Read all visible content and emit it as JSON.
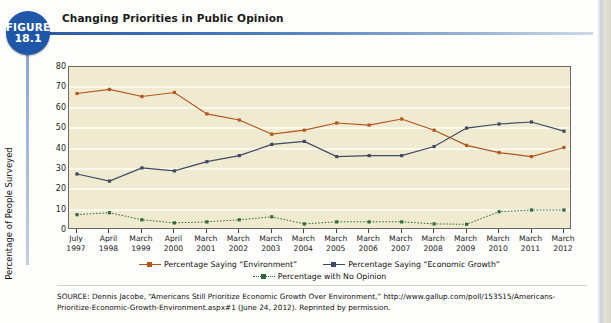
{
  "figure": {
    "badge_label": "FIGURE",
    "badge_number": "18.1"
  },
  "title": "Changing Priorities in Public Opinion",
  "source": "SOURCE: Dennis Jacobe, “Americans Still Prioritize Economic Growth Over Environment,” http://www.gallup.com/poll/153515/Americans-Prioritize-Economic-Growth-Environment.aspx#1 (June 24, 2012). Reprinted by permission.",
  "colors": {
    "environment": "#b5561f",
    "economic_growth": "#3c4a63",
    "no_opinion": "#2f6b42",
    "plot_background": "#f0ead0",
    "gridline": "#fbf8ec",
    "badge_blue": "#1e57a8",
    "title_rule": "#2a5ea8"
  },
  "chart_data": {
    "type": "line",
    "title": "Changing Priorities in Public Opinion",
    "xlabel": "",
    "ylabel": "Percentage of People Surveyed",
    "ylim": [
      0,
      80
    ],
    "yticks": [
      0,
      10,
      20,
      30,
      40,
      50,
      60,
      70,
      80
    ],
    "grid": true,
    "legend_position": "bottom",
    "categories": [
      "July 1997",
      "April 1998",
      "March 1999",
      "April 2000",
      "March 2001",
      "March 2002",
      "March 2003",
      "March 2004",
      "March 2005",
      "March 2006",
      "March 2007",
      "March 2008",
      "March 2009",
      "March 2010",
      "March 2011",
      "March 2012"
    ],
    "category_lines": [
      [
        "July",
        "1997"
      ],
      [
        "April",
        "1998"
      ],
      [
        "March",
        "1999"
      ],
      [
        "April",
        "2000"
      ],
      [
        "March",
        "2001"
      ],
      [
        "March",
        "2002"
      ],
      [
        "March",
        "2003"
      ],
      [
        "March",
        "2004"
      ],
      [
        "March",
        "2005"
      ],
      [
        "March",
        "2006"
      ],
      [
        "March",
        "2007"
      ],
      [
        "March",
        "2008"
      ],
      [
        "March",
        "2009"
      ],
      [
        "March",
        "2010"
      ],
      [
        "March",
        "2011"
      ],
      [
        "March",
        "2012"
      ]
    ],
    "series": [
      {
        "name": "Percentage Saying “Environment”",
        "color": "#b5561f",
        "style": "solid",
        "values": [
          67,
          69,
          65.5,
          67.5,
          57,
          54,
          47,
          49,
          52.5,
          51.5,
          54.5,
          49,
          41.5,
          38,
          36,
          40.5
        ]
      },
      {
        "name": "Percentage Saying “Economic Growth”",
        "color": "#3c4a63",
        "style": "solid",
        "values": [
          27.5,
          24,
          30.5,
          29,
          33.5,
          36.5,
          42,
          43.5,
          36,
          36.5,
          36.5,
          41,
          50,
          52,
          53,
          48.5
        ]
      },
      {
        "name": "Percentage with No Opinion",
        "color": "#2f6b42",
        "style": "dotted",
        "values": [
          7.5,
          8.5,
          5,
          3.5,
          4,
          5,
          6.5,
          3,
          4,
          4,
          4,
          3,
          2.8,
          9,
          9.8,
          9.8
        ]
      }
    ]
  },
  "legend": [
    {
      "label": "Percentage Saying “Environment”",
      "color": "#b5561f"
    },
    {
      "label": "Percentage Saying “Economic Growth”",
      "color": "#3c4a63"
    },
    {
      "label": "Percentage with No Opinion",
      "color": "#2f6b42"
    }
  ]
}
